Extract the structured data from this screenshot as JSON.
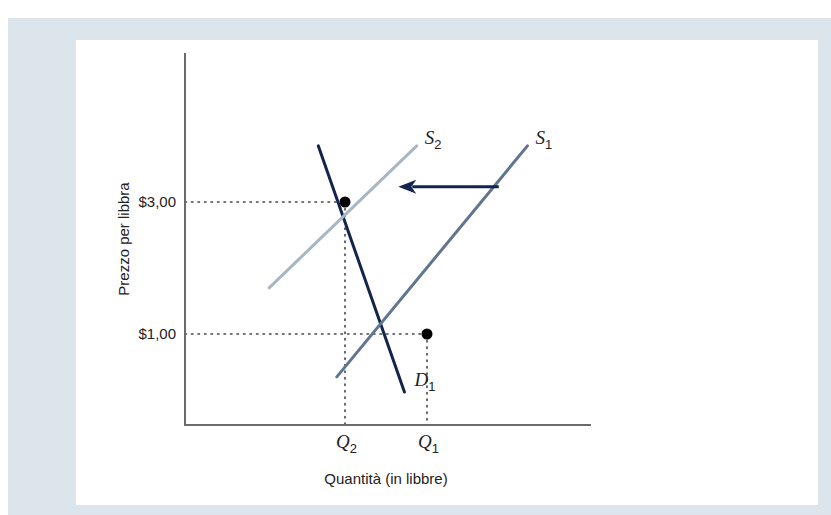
{
  "chart_data": {
    "type": "line",
    "title": "",
    "xlabel": "Quantità (in libbre)",
    "ylabel": "Prezzo per libbra",
    "x_ticks": [
      {
        "label": "Q",
        "sub": "2",
        "q": 2
      },
      {
        "label": "Q",
        "sub": "1",
        "q": 4
      }
    ],
    "y_ticks": [
      {
        "label": "$3,00",
        "value": 3
      },
      {
        "label": "$1,00",
        "value": 1
      }
    ],
    "xlim": [
      0,
      7
    ],
    "ylim": [
      -0.4,
      4.3
    ],
    "series": [
      {
        "name": "D",
        "sub": "1",
        "color": "#13244f",
        "points": [
          [
            1.35,
            3.85
          ],
          [
            3.45,
            0.12
          ]
        ]
      },
      {
        "name": "S",
        "sub": "2",
        "color": "#a9b6c3",
        "points": [
          [
            0.15,
            1.7
          ],
          [
            3.75,
            3.85
          ]
        ]
      },
      {
        "name": "S",
        "sub": "1",
        "color": "#5f7590",
        "points": [
          [
            1.8,
            0.35
          ],
          [
            6.45,
            3.85
          ]
        ]
      }
    ],
    "equilibria": [
      {
        "name": "E2",
        "q_label": "Q2",
        "price_label": "$3,00",
        "x": 2,
        "y": 3
      },
      {
        "name": "E1",
        "q_label": "Q1",
        "price_label": "$1,00",
        "x": 4,
        "y": 1
      }
    ],
    "annotations": [
      {
        "type": "arrow",
        "description": "supply shift left from S1 to S2",
        "from": [
          5.75,
          3.23
        ],
        "to": [
          3.3,
          3.23
        ],
        "color": "#13244f"
      }
    ],
    "grid": false,
    "legend": "inline labels at curve ends"
  }
}
